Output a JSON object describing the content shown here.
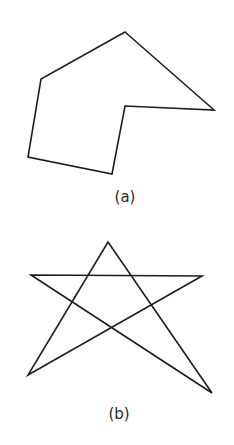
{
  "figures": [
    {
      "label": "(a)",
      "shape": "concave hexagon",
      "points": "125,32 214,110 125,106 112,174 28,157 41,79",
      "label_pos": {
        "x": 125,
        "y": 188
      }
    },
    {
      "label": "(b)",
      "shape": "irregular pentagram",
      "points": "31,275 202,276 28,375 108,242 212,393",
      "label_pos": {
        "x": 119,
        "y": 405
      }
    }
  ],
  "colors": {
    "stroke": "#1e1e1e",
    "background": "#ffffff"
  }
}
